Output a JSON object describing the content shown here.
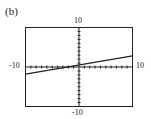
{
  "panel_label": "(b)",
  "chart_data": {
    "type": "line",
    "title": "(b)",
    "xlabel": "",
    "ylabel": "",
    "xlim": [
      -10,
      10
    ],
    "ylim": [
      -10,
      10
    ],
    "tick_labels": {
      "x_min": "-10",
      "x_max": "10",
      "y_min": "-10",
      "y_max": "10"
    },
    "grid": false,
    "tick_marks_every": 1,
    "series": [
      {
        "name": "line",
        "x": [
          -10,
          10
        ],
        "y": [
          -1.8,
          2.8
        ]
      }
    ]
  }
}
